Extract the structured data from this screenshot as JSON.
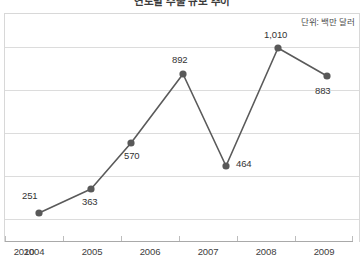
{
  "chart_data": {
    "type": "line",
    "title": "연도별 수출 규모 추이",
    "subtitle": "",
    "unit_label": "단위: 백만 달러",
    "xlabel": "",
    "ylabel": "",
    "categories": [
      "2004",
      "2005",
      "2006",
      "2007",
      "2008",
      "2009",
      "2010"
    ],
    "values": [
      251,
      363,
      570,
      892,
      464,
      1010,
      883
    ],
    "value_labels": [
      "251",
      "363",
      "570",
      "892",
      "464",
      "1,010",
      "883"
    ],
    "series": [
      {
        "name": "수출액",
        "values": [
          251,
          363,
          570,
          892,
          464,
          1010,
          883
        ]
      }
    ],
    "ylim": [
      0,
      1010
    ],
    "gridlines": [
      1010,
      810,
      610,
      410,
      210
    ],
    "grid": true,
    "legend": "none",
    "marker": "circle",
    "line_color": "#5a5a5a",
    "marker_color": "#595959",
    "grid_color": "#dcdcdc",
    "axis_color": "#a9a9a9",
    "label_color": "#333333",
    "background": "#ffffff"
  },
  "geometry": {
    "points": [
      {
        "cx": 39,
        "cy": 213,
        "label_x": 22,
        "label_y": 190
      },
      {
        "cx": 91,
        "cy": 189,
        "label_x": 82,
        "label_y": 196
      },
      {
        "cx": 131,
        "cy": 143,
        "label_x": 124,
        "label_y": 150
      },
      {
        "cx": 183,
        "cy": 74,
        "label_x": 172,
        "label_y": 54
      },
      {
        "cx": 226,
        "cy": 166,
        "label_x": 236,
        "label_y": 158
      },
      {
        "cx": 278,
        "cy": 48,
        "label_x": 264,
        "label_y": 29
      },
      {
        "cx": 327,
        "cy": 76,
        "label_x": 315,
        "label_y": 85
      }
    ],
    "gridline_y": [
      47,
      90,
      133,
      176,
      219
    ],
    "tick_x": [
      5,
      63,
      121,
      179,
      237,
      295,
      352
    ],
    "xlabel_x": [
      10,
      68,
      126,
      184,
      242,
      300
    ],
    "xlabel_w": 48
  }
}
